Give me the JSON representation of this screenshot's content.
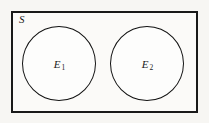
{
  "figure": {
    "type": "venn-diagram",
    "background_color": "#f7f6f3",
    "line_color": "#191919"
  },
  "sample_space": {
    "label": "S",
    "fill_color": "#fbfaf8",
    "border_color": "#191919"
  },
  "events": [
    {
      "name": "event-e1",
      "label_base": "E",
      "label_subscript": "1",
      "fill_color": "#fdfdfc",
      "border_color": "#111111"
    },
    {
      "name": "event-e2",
      "label_base": "E",
      "label_subscript": "2",
      "fill_color": "#fdfdfc",
      "border_color": "#111111"
    }
  ]
}
